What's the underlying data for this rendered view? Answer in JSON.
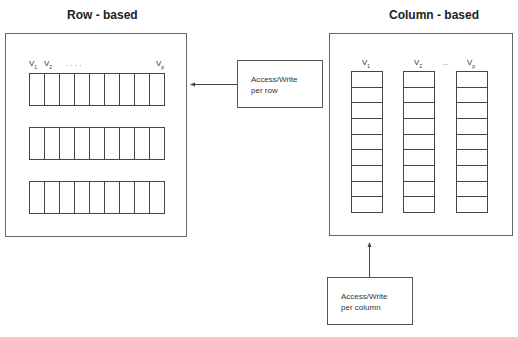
{
  "row_based": {
    "title": "Row - based",
    "labels": {
      "v1": "V",
      "v1_sub": "1",
      "v2": "V",
      "v2_sub": "2",
      "vp": "V",
      "vp_sub": "p",
      "dots": ".   .   .   ."
    },
    "rows": 3,
    "cells_per_row": 9
  },
  "column_based": {
    "title": "Column - based",
    "labels": {
      "v1": "V",
      "v1_sub": "1",
      "v2": "V",
      "v2_sub": "2",
      "vp": "V",
      "vp_sub": "p",
      "dots": "..."
    },
    "columns": 3,
    "cells_per_column": 9
  },
  "callouts": {
    "per_row": {
      "line1": "Access/Write",
      "line2": "per row"
    },
    "per_column": {
      "line1": "Access/Write",
      "line2": "per column"
    }
  },
  "colors": {
    "line": "#444444",
    "panel_border": "#666666",
    "text": "#222222"
  }
}
